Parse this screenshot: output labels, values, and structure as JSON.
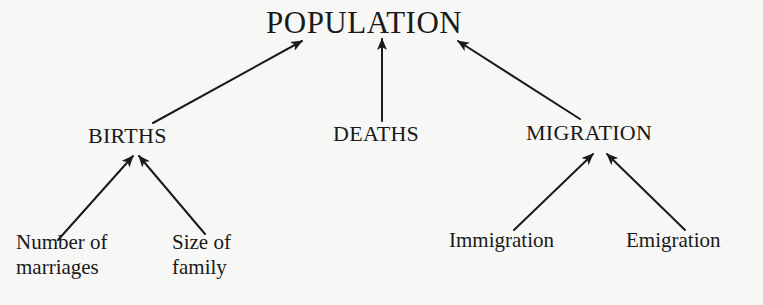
{
  "diagram": {
    "type": "tree",
    "direction": "bottom-up",
    "root": {
      "id": "population",
      "label": "POPULATION"
    },
    "level1": [
      {
        "id": "births",
        "label": "BIRTHS"
      },
      {
        "id": "deaths",
        "label": "DEATHS"
      },
      {
        "id": "migration",
        "label": "MIGRATION"
      }
    ],
    "leaves": [
      {
        "id": "marriages",
        "parent": "births",
        "lines": [
          "Number of",
          "marriages"
        ]
      },
      {
        "id": "family",
        "parent": "births",
        "lines": [
          "Size of",
          "family"
        ]
      },
      {
        "id": "immigration",
        "parent": "migration",
        "lines": [
          "Immigration"
        ]
      },
      {
        "id": "emigration",
        "parent": "migration",
        "lines": [
          "Emigration"
        ]
      }
    ],
    "edges": [
      {
        "from": "births",
        "to": "population"
      },
      {
        "from": "deaths",
        "to": "population"
      },
      {
        "from": "migration",
        "to": "population"
      },
      {
        "from": "marriages",
        "to": "births"
      },
      {
        "from": "family",
        "to": "births"
      },
      {
        "from": "immigration",
        "to": "migration"
      },
      {
        "from": "emigration",
        "to": "migration"
      }
    ],
    "colors": {
      "background": "#f7f7f5",
      "ink": "#1a1a1a"
    }
  }
}
